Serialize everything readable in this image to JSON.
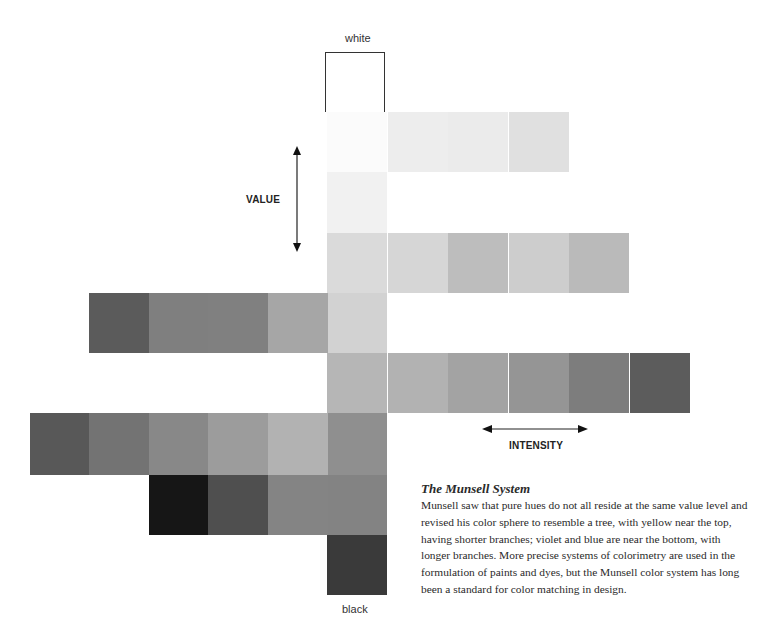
{
  "labels": {
    "top": "white",
    "bottom": "black",
    "value_axis": "VALUE",
    "intensity_axis": "INTENSITY"
  },
  "caption": {
    "title": "The Munsell System",
    "body": "Munsell saw that pure hues do not all reside at the same value level and revised his color sphere to resemble a tree, with yellow near the top, having shorter branches; violet and blue are near the bottom, with longer branches. More precise systems of colorimetry are used in the formulation of paints and dyes, but the Munsell color system has long been a standard for color matching in design."
  },
  "grid": {
    "cell_size": 60,
    "center_x": 327,
    "rows": [
      {
        "y": 112,
        "center": "#fbfbfb",
        "left": [],
        "right": [
          "#ededed",
          "#ebebeb",
          "#e0e0e0"
        ]
      },
      {
        "y": 172,
        "center": "#f1f1f1",
        "left": [],
        "right": []
      },
      {
        "y": 233,
        "center": "#dadada",
        "left": [],
        "right": [
          "#d6d6d6",
          "#bdbdbd",
          "#cdcdcd",
          "#bababa"
        ]
      },
      {
        "y": 293,
        "center": "#d2d2d2",
        "left": [
          "#5b5b5b",
          "#7f7f7f",
          "#808080",
          "#a6a6a6"
        ],
        "right": []
      },
      {
        "y": 353,
        "center": "#b6b6b6",
        "left": [],
        "right": [
          "#b2b2b2",
          "#a3a3a3",
          "#959595",
          "#7d7d7d",
          "#5c5c5c"
        ]
      },
      {
        "y": 413,
        "center": "#8f8f8f",
        "left": [
          "#585858",
          "#737373",
          "#888888",
          "#9c9c9c",
          "#b2b2b2"
        ],
        "right": []
      },
      {
        "y": 475,
        "center": "#838383",
        "left": [
          "#161616",
          "#4f4f4f",
          "#848484"
        ],
        "right": []
      },
      {
        "y": 535,
        "center": "#3a3a3a",
        "left": [],
        "right": []
      }
    ]
  }
}
